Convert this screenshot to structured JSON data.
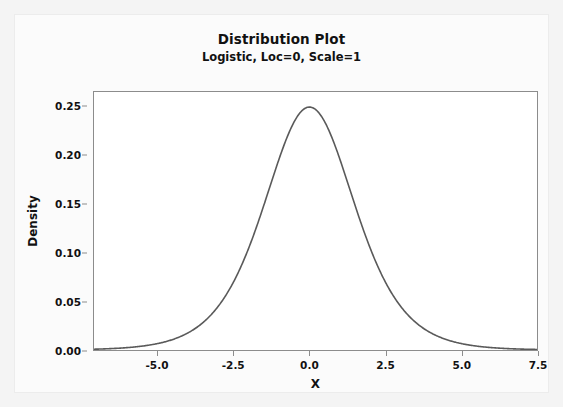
{
  "chart_data": {
    "type": "line",
    "title": "Distribution Plot",
    "subtitle": "Logistic, Loc=0, Scale=1",
    "xlabel": "X",
    "ylabel": "Density",
    "xlim": [
      -7.1,
      7.5
    ],
    "ylim": [
      0.0,
      0.2655
    ],
    "grid": false,
    "legend": null,
    "xticks": [
      "-5.0",
      "-2.5",
      "0.0",
      "2.5",
      "5.0",
      "7.5"
    ],
    "xtick_values": [
      -5.0,
      -2.5,
      0.0,
      2.5,
      5.0,
      7.5
    ],
    "yticks": [
      "0.00",
      "0.05",
      "0.10",
      "0.15",
      "0.20",
      "0.25"
    ],
    "ytick_values": [
      0.0,
      0.05,
      0.1,
      0.15,
      0.2,
      0.25
    ],
    "line_color": "#5a5a5a",
    "line_width": 1.6,
    "distribution": "Logistic",
    "loc": 0,
    "scale": 1,
    "series": [
      {
        "name": "Logistic, Loc=0, Scale=1",
        "x": [
          -7.1,
          -6.8,
          -6.5,
          -6.2,
          -5.9,
          -5.6,
          -5.3,
          -5.0,
          -4.7,
          -4.4,
          -4.1,
          -3.8,
          -3.5,
          -3.2,
          -2.9,
          -2.6,
          -2.3,
          -2.0,
          -1.7,
          -1.4,
          -1.1,
          -0.8,
          -0.5,
          -0.2,
          0.0,
          0.2,
          0.5,
          0.8,
          1.1,
          1.4,
          1.7,
          2.0,
          2.3,
          2.6,
          2.9,
          3.2,
          3.5,
          3.8,
          4.1,
          4.4,
          4.7,
          5.0,
          5.3,
          5.6,
          5.9,
          6.2,
          6.5,
          6.8,
          7.1,
          7.5
        ],
        "y": [
          0.00082,
          0.00111,
          0.0015,
          0.00202,
          0.00273,
          0.00368,
          0.00497,
          0.0066,
          0.00898,
          0.01209,
          0.01626,
          0.02183,
          0.02923,
          0.03897,
          0.05163,
          0.06777,
          0.08776,
          0.11141,
          0.13781,
          0.16524,
          0.19151,
          0.21443,
          0.23235,
          0.24503,
          0.25,
          0.24503,
          0.23235,
          0.21443,
          0.19151,
          0.16524,
          0.13781,
          0.11141,
          0.08776,
          0.06777,
          0.05163,
          0.03897,
          0.02923,
          0.02183,
          0.01626,
          0.01209,
          0.00898,
          0.0066,
          0.00497,
          0.00368,
          0.00273,
          0.00202,
          0.0015,
          0.00111,
          0.00082,
          0.00055
        ]
      }
    ]
  }
}
